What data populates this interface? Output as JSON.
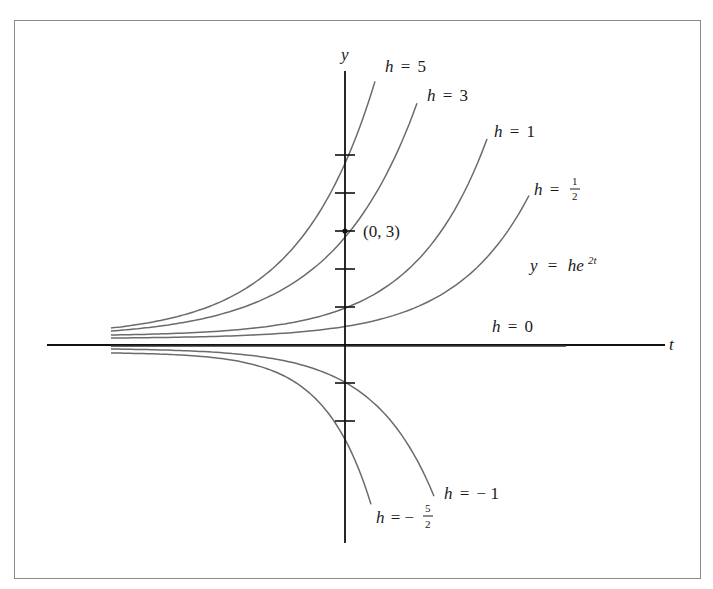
{
  "figure": {
    "equation": {
      "lhs": "y",
      "eq": "=",
      "base": "he",
      "exp": "2t"
    },
    "axes": {
      "x_label": "t",
      "y_label": "y",
      "origin_px": [
        345,
        345
      ],
      "unit_px": 38,
      "y_ticks": [
        -2,
        -1,
        1,
        2,
        3,
        4,
        5
      ]
    },
    "point": {
      "label": "(0, 3)",
      "t": 0,
      "y": 3
    },
    "curve_labels": {
      "h5": {
        "h": "h",
        "eq": "=",
        "val": "5"
      },
      "h3": {
        "h": "h",
        "eq": "=",
        "val": "3"
      },
      "h1": {
        "h": "h",
        "eq": "=",
        "val": "1"
      },
      "hhalf": {
        "h": "h",
        "eq": "=",
        "num": "1",
        "den": "2"
      },
      "h0": {
        "h": "h",
        "eq": "=",
        "val": "0"
      },
      "hneg1": {
        "h": "h",
        "eq": "=",
        "val": "− 1"
      },
      "hneg52": {
        "h": "h",
        "eq": "= −",
        "num": "5",
        "den": "2"
      }
    },
    "colors": {
      "axis": "#111111",
      "curve": "#6b6b6b",
      "frame": "#8a8a8a"
    }
  },
  "chart_data": {
    "type": "line",
    "xlabel": "t",
    "ylabel": "y",
    "grid": false,
    "y_ticks": [
      -2,
      -1,
      1,
      2,
      3,
      4,
      5
    ],
    "annotations": [
      "(0, 3)",
      "y = he^{2t}"
    ],
    "series": [
      {
        "name": "h = 5",
        "h": 5,
        "y_at_t0": 5,
        "start_px": [
          111,
          328
        ],
        "end_px": [
          375,
          73
        ]
      },
      {
        "name": "h = 3",
        "h": 3,
        "y_at_t0": 3,
        "start_px": [
          111,
          331
        ],
        "end_px": [
          417,
          97
        ]
      },
      {
        "name": "h = 1",
        "h": 1,
        "y_at_t0": 1,
        "start_px": [
          111,
          335
        ],
        "end_px": [
          487,
          138
        ]
      },
      {
        "name": "h = 1/2",
        "h": 0.5,
        "y_at_t0": 0.5,
        "start_px": [
          111,
          338
        ],
        "end_px": [
          529,
          195
        ]
      },
      {
        "name": "h = 0",
        "h": 0,
        "y_at_t0": 0,
        "start_px": [
          111,
          345
        ],
        "end_px": [
          566,
          345
        ]
      },
      {
        "name": "h = -1",
        "h": -1,
        "y_at_t0": -1,
        "start_px": [
          111,
          349
        ],
        "end_px": [
          434,
          497
        ]
      },
      {
        "name": "h = -5/2",
        "h": -2.5,
        "y_at_t0": -2.5,
        "start_px": [
          111,
          353
        ],
        "end_px": [
          371,
          505
        ]
      }
    ]
  }
}
